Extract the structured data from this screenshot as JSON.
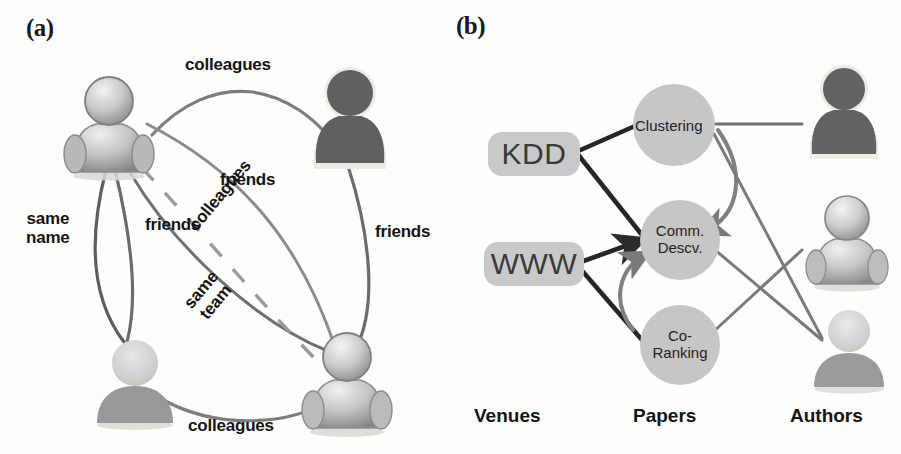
{
  "figure": {
    "width": 901,
    "height": 454,
    "background": "#fdfdfc"
  },
  "panel_a": {
    "tag": "(a)",
    "description": "Homogeneous social network of four persons connected by typed relations",
    "nodes": [
      {
        "id": "p1",
        "name": "person-top-left",
        "style": "glossy-gray",
        "x": 108,
        "y": 125
      },
      {
        "id": "p2",
        "name": "person-top-right",
        "style": "dark-solid",
        "x": 348,
        "y": 118
      },
      {
        "id": "p3",
        "name": "person-bottom-left",
        "style": "light-faded",
        "x": 133,
        "y": 380
      },
      {
        "id": "p4",
        "name": "person-bottom-right",
        "style": "glossy-gray",
        "x": 346,
        "y": 382
      }
    ],
    "edges": [
      {
        "id": "e1",
        "label": "colleagues",
        "from": "p1",
        "to": "p2",
        "style": "solid"
      },
      {
        "id": "e2",
        "label": "same\nname",
        "from": "p1",
        "to": "p3",
        "style": "solid"
      },
      {
        "id": "e3",
        "label": "friends",
        "from": "p1",
        "to": "p3",
        "style": "solid"
      },
      {
        "id": "e4",
        "label": "friends",
        "from": "p1",
        "to": "p4",
        "style": "solid"
      },
      {
        "id": "e5",
        "label": "colleagues",
        "from": "p1",
        "to": "p4",
        "style": "solid"
      },
      {
        "id": "e6",
        "label": "same\nteam",
        "from": "p1",
        "to": "p4",
        "style": "dashed"
      },
      {
        "id": "e7",
        "label": "friends",
        "from": "p2",
        "to": "p4",
        "style": "solid"
      },
      {
        "id": "e8",
        "label": "colleagues",
        "from": "p3",
        "to": "p4",
        "style": "solid"
      }
    ],
    "labels": {
      "colleagues_top": "colleagues",
      "same_name": "same\nname",
      "friends_left": "friends",
      "friends_mid": "friends",
      "colleagues_diag": "colleagues",
      "same_team": "same\nteam",
      "friends_right": "friends",
      "colleagues_bottom": "colleagues"
    }
  },
  "panel_b": {
    "tag": "(b)",
    "description": "Heterogeneous bibliographic network linking venues, papers and authors",
    "column_labels": {
      "venues": "Venues",
      "papers": "Papers",
      "authors": "Authors"
    },
    "venues": [
      {
        "id": "v1",
        "label": "KDD",
        "x": 38,
        "y": 140
      },
      {
        "id": "v2",
        "label": "WWW",
        "x": 38,
        "y": 245
      }
    ],
    "papers": [
      {
        "id": "pa1",
        "label": "Clustering",
        "x": 175,
        "y": 82
      },
      {
        "id": "pa2",
        "label": "Comm.\nDescv.",
        "x": 175,
        "y": 197
      },
      {
        "id": "pa3",
        "label": "Co-\nRanking",
        "x": 175,
        "y": 305
      }
    ],
    "authors": [
      {
        "id": "a1",
        "name": "author-top",
        "style": "dark-solid",
        "x": 328,
        "y": 60
      },
      {
        "id": "a2",
        "name": "author-middle",
        "style": "glossy-gray",
        "x": 330,
        "y": 195
      },
      {
        "id": "a3",
        "name": "author-bottom",
        "style": "light-faded",
        "x": 330,
        "y": 300
      }
    ],
    "edges": [
      {
        "id": "be1",
        "from": "v1",
        "to": "pa1",
        "kind": "venue-paper",
        "arrow": false
      },
      {
        "id": "be2",
        "from": "v1",
        "to": "pa2",
        "kind": "venue-paper",
        "arrow": false
      },
      {
        "id": "be3",
        "from": "v2",
        "to": "pa2",
        "kind": "venue-paper",
        "arrow": false
      },
      {
        "id": "be4",
        "from": "v2",
        "to": "pa3",
        "kind": "venue-paper",
        "arrow": false
      },
      {
        "id": "be5",
        "from": "pa1",
        "to": "pa2",
        "kind": "citation",
        "arrow": true
      },
      {
        "id": "be6",
        "from": "pa3",
        "to": "pa2",
        "kind": "citation",
        "arrow": true
      },
      {
        "id": "be7",
        "from": "pa1",
        "to": "a1",
        "kind": "paper-author",
        "arrow": false
      },
      {
        "id": "be8",
        "from": "pa1",
        "to": "a3",
        "kind": "paper-author",
        "arrow": false
      },
      {
        "id": "be9",
        "from": "pa2",
        "to": "a3",
        "kind": "paper-author",
        "arrow": false
      },
      {
        "id": "be10",
        "from": "pa3",
        "to": "a2",
        "kind": "paper-author",
        "arrow": false
      }
    ]
  },
  "colors": {
    "venue_pill": "#c9c9c9",
    "paper_circle": "#c6c6c6",
    "edge_gray": "#6e6e6e",
    "edge_dark": "#2d2d2d",
    "text_dark": "#141414",
    "avatar_dark": "#585858",
    "avatar_light": "#c3c3c3",
    "avatar_glossy": "#b4b4b4",
    "halo": "#e4e4e0"
  }
}
